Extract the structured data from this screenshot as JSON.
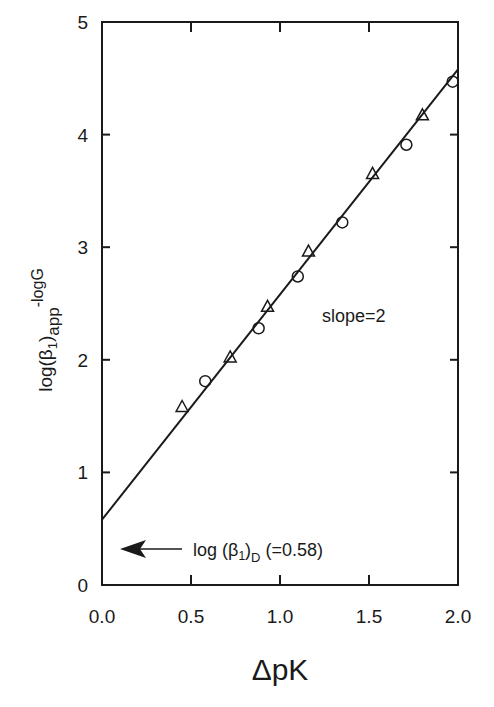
{
  "chart_data": {
    "type": "scatter",
    "title": "",
    "xlabel": "ΔpK",
    "ylabel": "log(β1)app - logG",
    "ylabel_parts": {
      "main": "log(β",
      "sub1": "1",
      "close": ")",
      "sub2": "app",
      "sup": "-logG"
    },
    "xlim": [
      0.0,
      2.0
    ],
    "ylim": [
      0,
      5
    ],
    "xticks": [
      0.0,
      0.5,
      1.0,
      1.5,
      2.0
    ],
    "xtick_labels": [
      "0.0",
      "0.5",
      "1.0",
      "1.5",
      "2.0"
    ],
    "yticks": [
      0,
      1,
      2,
      3,
      4,
      5
    ],
    "ytick_labels": [
      "0",
      "1",
      "2",
      "3",
      "4",
      "5"
    ],
    "grid": false,
    "legend": null,
    "series": [
      {
        "name": "triangles",
        "marker": "open-triangle",
        "x": [
          0.45,
          0.72,
          0.93,
          1.16,
          1.52,
          1.8
        ],
        "y": [
          1.58,
          2.02,
          2.47,
          2.96,
          3.65,
          4.17
        ]
      },
      {
        "name": "circles",
        "marker": "open-circle",
        "x": [
          0.58,
          0.88,
          1.1,
          1.35,
          1.71,
          1.97
        ],
        "y": [
          1.81,
          2.28,
          2.74,
          3.22,
          3.91,
          4.47
        ]
      },
      {
        "name": "fit line",
        "type": "line",
        "slope": 2,
        "intercept": 0.58,
        "x": [
          0.0,
          2.0
        ],
        "y": [
          0.58,
          4.58
        ]
      }
    ],
    "annotations": [
      {
        "text": "slope=2",
        "x": 1.45,
        "y": 2.1
      },
      {
        "text": "log (β1)D (=0.58)",
        "parts": {
          "main": "log (β",
          "sub1": "1",
          "close": ")",
          "sub2": "D",
          "tail": " (=0.58)"
        },
        "arrow_to": [
          0.0,
          0.58
        ]
      }
    ]
  }
}
